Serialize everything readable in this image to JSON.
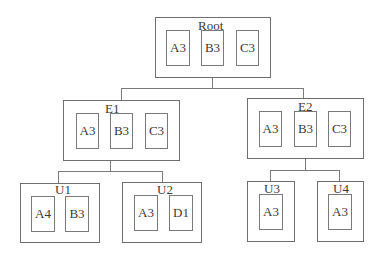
{
  "diagram": {
    "type": "tree",
    "nodes": {
      "root": {
        "label": "Root",
        "items": [
          "A3",
          "B3",
          "C3"
        ]
      },
      "e1": {
        "label": "E1",
        "items": [
          "A3",
          "B3",
          "C3"
        ]
      },
      "e2": {
        "label": "E2",
        "items": [
          "A3",
          "B3",
          "C3"
        ]
      },
      "u1": {
        "label": "U1",
        "items": [
          "A4",
          "B3"
        ]
      },
      "u2": {
        "label": "U2",
        "items": [
          "A3",
          "D1"
        ]
      },
      "u3": {
        "label": "U3",
        "items": [
          "A3"
        ]
      },
      "u4": {
        "label": "U4",
        "items": [
          "A3"
        ]
      }
    },
    "edges": [
      [
        "Root",
        "E1"
      ],
      [
        "Root",
        "E2"
      ],
      [
        "E1",
        "U1"
      ],
      [
        "E1",
        "U2"
      ],
      [
        "E2",
        "U3"
      ],
      [
        "E2",
        "U4"
      ]
    ],
    "colors": {
      "stroke": "#6e6e6e",
      "text": "#3a3a3a",
      "background": "#ffffff"
    }
  }
}
